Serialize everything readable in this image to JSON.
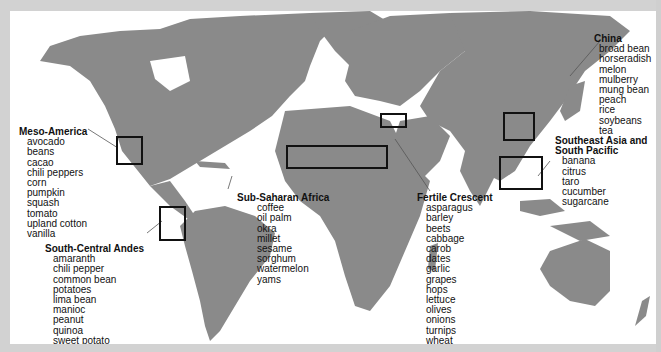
{
  "map": {
    "colors": {
      "land": "#8a8a8a",
      "ocean": "#ffffff",
      "frame": "#d2d2d2",
      "box": "#111111"
    },
    "regions": [
      {
        "id": "meso-america",
        "title": "Meso-America",
        "crops": [
          "avocado",
          "beans",
          "cacao",
          "chili peppers",
          "corn",
          "pumpkin",
          "squash",
          "tomato",
          "upland cotton",
          "vanilla"
        ]
      },
      {
        "id": "south-central-andes",
        "title": "South-Central Andes",
        "crops": [
          "amaranth",
          "chili pepper",
          "common bean",
          "potatoes",
          "lima bean",
          "manioc",
          "peanut",
          "quinoa",
          "sweet potato"
        ]
      },
      {
        "id": "sub-saharan-africa",
        "title": "Sub-Saharan Africa",
        "crops": [
          "coffee",
          "oil palm",
          "okra",
          "millet",
          "sesame",
          "sorghum",
          "watermelon",
          "yams"
        ]
      },
      {
        "id": "fertile-crescent",
        "title": "Fertile Crescent",
        "crops": [
          "asparagus",
          "barley",
          "beets",
          "cabbage",
          "carob",
          "dates",
          "garlic",
          "grapes",
          "hops",
          "lettuce",
          "olives",
          "onions",
          "turnips",
          "wheat"
        ]
      },
      {
        "id": "china",
        "title": "China",
        "crops": [
          "broad bean",
          "horseradish",
          "melon",
          "mulberry",
          "mung bean",
          "peach",
          "rice",
          "soybeans",
          "tea"
        ]
      },
      {
        "id": "southeast-asia-south-pacific",
        "title_line1": "Southeast Asia and",
        "title_line2": "South Pacific",
        "crops": [
          "banana",
          "citrus",
          "taro",
          "cucumber",
          "sugarcane"
        ]
      }
    ]
  }
}
